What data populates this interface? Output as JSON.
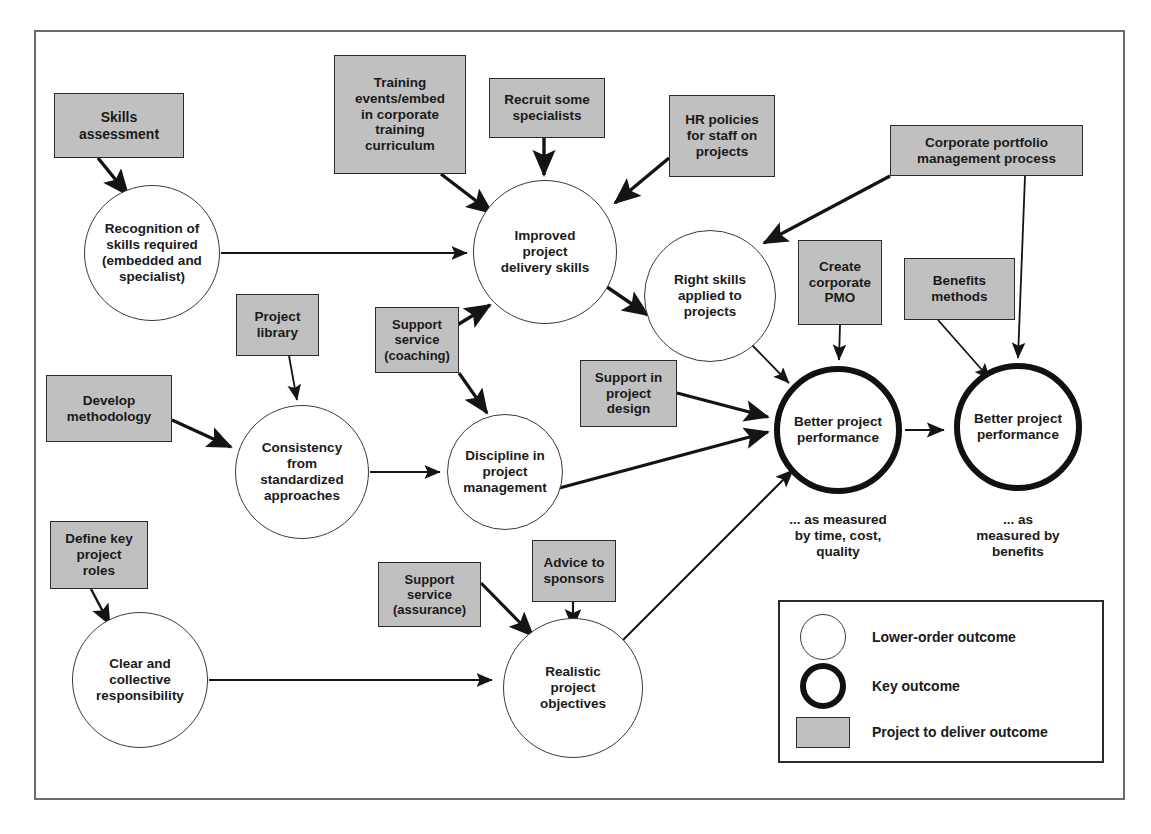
{
  "diagram": {
    "type": "outcome-relationship-map",
    "frame": {
      "border_color": "#6c6c6c"
    },
    "palette": {
      "project_box_fill": "#c0c0c0",
      "project_box_stroke": "#2b2b2b",
      "lower_outcome_stroke": "#3a3a3a",
      "key_outcome_stroke": "#111111",
      "arrow_color": "#141414",
      "text_color": "#1a1a1a"
    },
    "project_boxes": [
      {
        "id": "skills-assessment",
        "label": "Skills\nassessment",
        "x": 54,
        "y": 93,
        "w": 130,
        "h": 65
      },
      {
        "id": "training-events",
        "label": "Training\nevents/embed\nin corporate\ntraining\ncurriculum",
        "x": 334,
        "y": 55,
        "w": 132,
        "h": 119
      },
      {
        "id": "recruit-specialists",
        "label": "Recruit some\nspecialists",
        "x": 489,
        "y": 78,
        "w": 116,
        "h": 60
      },
      {
        "id": "hr-policies",
        "label": "HR policies\nfor staff on\nprojects",
        "x": 669,
        "y": 95,
        "w": 106,
        "h": 82
      },
      {
        "id": "corporate-portfolio",
        "label": "Corporate portfolio\nmanagement process",
        "x": 890,
        "y": 125,
        "w": 193,
        "h": 51
      },
      {
        "id": "project-library",
        "label": "Project\nlibrary",
        "x": 236,
        "y": 294,
        "w": 83,
        "h": 62
      },
      {
        "id": "support-coaching",
        "label": "Support\nservice\n(coaching)",
        "x": 375,
        "y": 307,
        "w": 84,
        "h": 66
      },
      {
        "id": "create-pmo",
        "label": "Create\ncorporate\nPMO",
        "x": 798,
        "y": 240,
        "w": 84,
        "h": 85
      },
      {
        "id": "benefits-methods",
        "label": "Benefits\nmethods",
        "x": 904,
        "y": 258,
        "w": 111,
        "h": 62
      },
      {
        "id": "develop-methodology",
        "label": "Develop\nmethodology",
        "x": 46,
        "y": 375,
        "w": 126,
        "h": 67
      },
      {
        "id": "support-project-design",
        "label": "Support in\nproject\ndesign",
        "x": 580,
        "y": 360,
        "w": 97,
        "h": 67
      },
      {
        "id": "define-key-roles",
        "label": "Define key\nproject\nroles",
        "x": 50,
        "y": 521,
        "w": 98,
        "h": 68
      },
      {
        "id": "support-assurance",
        "label": "Support\nservice\n(assurance)",
        "x": 378,
        "y": 562,
        "w": 103,
        "h": 65
      },
      {
        "id": "advice-to-sponsors",
        "label": "Advice to\nsponsors",
        "x": 532,
        "y": 540,
        "w": 84,
        "h": 62
      }
    ],
    "outcome_circles": [
      {
        "id": "recognition-of-skills",
        "kind": "lower",
        "label": "Recognition of\nskills required\n(embedded and\nspecialist)",
        "cx": 152,
        "cy": 253,
        "r": 68
      },
      {
        "id": "improved-delivery-skills",
        "kind": "lower",
        "label": "Improved\nproject\ndelivery skills",
        "cx": 545,
        "cy": 252,
        "r": 72
      },
      {
        "id": "right-skills-applied",
        "kind": "lower",
        "label": "Right skills\napplied to\nprojects",
        "cx": 710,
        "cy": 296,
        "r": 66
      },
      {
        "id": "consistency-standardized",
        "kind": "lower",
        "label": "Consistency\nfrom\nstandardized\napproaches",
        "cx": 302,
        "cy": 472,
        "r": 67
      },
      {
        "id": "discipline-project-mgmt",
        "kind": "lower",
        "label": "Discipline in\nproject\nmanagement",
        "cx": 505,
        "cy": 472,
        "r": 58
      },
      {
        "id": "clear-collective-responsibility",
        "kind": "lower",
        "label": "Clear and\ncollective\nresponsibility",
        "cx": 140,
        "cy": 680,
        "r": 68
      },
      {
        "id": "realistic-project-objectives",
        "kind": "lower",
        "label": "Realistic\nproject\nobjectives",
        "cx": 573,
        "cy": 688,
        "r": 70
      },
      {
        "id": "better-performance-time",
        "kind": "key",
        "label": "Better project\nperformance",
        "cx": 838,
        "cy": 430,
        "r": 64
      },
      {
        "id": "better-performance-benefits",
        "kind": "key",
        "label": "Better project\nperformance",
        "cx": 1018,
        "cy": 427,
        "r": 64
      }
    ],
    "captions": [
      {
        "id": "caption-time-cost-quality",
        "text": "... as measured\nby time, cost,\nquality",
        "x": 763,
        "y": 512,
        "w": 150
      },
      {
        "id": "caption-benefits",
        "text": "... as\nmeasured by\nbenefits",
        "x": 948,
        "y": 512,
        "w": 140
      }
    ],
    "legend": {
      "title": "",
      "items": [
        {
          "id": "legend-lower-order-outcome",
          "swatch": "thin-circle",
          "label": "Lower-order outcome"
        },
        {
          "id": "legend-key-outcome",
          "swatch": "thick-circle",
          "label": "Key outcome"
        },
        {
          "id": "legend-project-to-deliver-outcome",
          "swatch": "grey-rect",
          "label": "Project to deliver outcome"
        }
      ]
    },
    "edges": [
      {
        "from": "skills-assessment",
        "to": "recognition-of-skills",
        "style": "thick-arrow"
      },
      {
        "from": "recognition-of-skills",
        "to": "improved-delivery-skills",
        "style": "thin-arrow"
      },
      {
        "from": "training-events",
        "to": "improved-delivery-skills",
        "style": "thick-arrow"
      },
      {
        "from": "recruit-specialists",
        "to": "improved-delivery-skills",
        "style": "thick-arrow"
      },
      {
        "from": "hr-policies",
        "to": "improved-delivery-skills",
        "style": "thick-arrow"
      },
      {
        "from": "support-coaching",
        "to": "improved-delivery-skills",
        "style": "thick-arrow"
      },
      {
        "from": "improved-delivery-skills",
        "to": "right-skills-applied",
        "style": "thick-arrow"
      },
      {
        "from": "corporate-portfolio",
        "to": "right-skills-applied",
        "style": "thick-arrow"
      },
      {
        "from": "corporate-portfolio",
        "to": "better-performance-benefits",
        "style": "thin-arrow"
      },
      {
        "from": "right-skills-applied",
        "to": "better-performance-time",
        "style": "thin-arrow"
      },
      {
        "from": "create-pmo",
        "to": "better-performance-time",
        "style": "thin-arrow"
      },
      {
        "from": "benefits-methods",
        "to": "better-performance-benefits",
        "style": "thin-arrow"
      },
      {
        "from": "project-library",
        "to": "consistency-standardized",
        "style": "thin-arrow"
      },
      {
        "from": "develop-methodology",
        "to": "consistency-standardized",
        "style": "thick-arrow"
      },
      {
        "from": "consistency-standardized",
        "to": "discipline-project-mgmt",
        "style": "thin-arrow"
      },
      {
        "from": "support-coaching",
        "to": "discipline-project-mgmt",
        "style": "thick-arrow"
      },
      {
        "from": "support-project-design",
        "to": "better-performance-time",
        "style": "thick-arrow"
      },
      {
        "from": "discipline-project-mgmt",
        "to": "better-performance-time",
        "style": "thick-arrow"
      },
      {
        "from": "define-key-roles",
        "to": "clear-collective-responsibility",
        "style": "thin-arrow"
      },
      {
        "from": "clear-collective-responsibility",
        "to": "realistic-project-objectives",
        "style": "thin-arrow"
      },
      {
        "from": "support-assurance",
        "to": "realistic-project-objectives",
        "style": "thick-arrow"
      },
      {
        "from": "advice-to-sponsors",
        "to": "realistic-project-objectives",
        "style": "thin-arrow"
      },
      {
        "from": "realistic-project-objectives",
        "to": "better-performance-time",
        "style": "thin-arrow"
      },
      {
        "from": "better-performance-time",
        "to": "better-performance-benefits",
        "style": "thin-arrow"
      }
    ]
  }
}
